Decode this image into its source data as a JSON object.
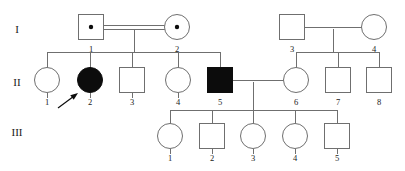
{
  "figure": {
    "type": "pedigree-chart",
    "width": 405,
    "height": 171,
    "background_color": "#ffffff",
    "line_color": "#6f6f6f",
    "affected_fill_color": "#0c0c0c",
    "unaffected_fill_color": "#ffffff",
    "text_color": "#1a1a1a"
  },
  "generation_labels": [
    {
      "name": "generation-1-label",
      "text": "I",
      "x": 17,
      "y": 30
    },
    {
      "name": "generation-2-label",
      "text": "II",
      "x": 17,
      "y": 83
    },
    {
      "name": "generation-3-label",
      "text": "III",
      "x": 17,
      "y": 133
    }
  ],
  "legend_semantics": {
    "square": "male",
    "circle": "female",
    "filled": "affected",
    "open": "unaffected",
    "center_dot": "carrier",
    "double_line": "consanguineous-mating",
    "arrow": "proband"
  },
  "individuals": [
    {
      "id": "I-1",
      "generation": "I",
      "number": "1",
      "sex": "male",
      "shape": "square",
      "status": "carrier",
      "filled": false,
      "carrier_dot": true,
      "cx": 91,
      "cy": 27,
      "size": 25
    },
    {
      "id": "I-2",
      "generation": "I",
      "number": "2",
      "sex": "female",
      "shape": "circle",
      "status": "carrier",
      "filled": false,
      "carrier_dot": true,
      "cx": 177,
      "cy": 27,
      "size": 25
    },
    {
      "id": "I-3",
      "generation": "I",
      "number": "3",
      "sex": "male",
      "shape": "square",
      "status": "unaffected",
      "filled": false,
      "carrier_dot": false,
      "cx": 292,
      "cy": 27,
      "size": 25
    },
    {
      "id": "I-4",
      "generation": "I",
      "number": "4",
      "sex": "female",
      "shape": "circle",
      "status": "unaffected",
      "filled": false,
      "carrier_dot": false,
      "cx": 374,
      "cy": 27,
      "size": 25
    },
    {
      "id": "II-1",
      "generation": "II",
      "number": "1",
      "sex": "female",
      "shape": "circle",
      "status": "unaffected",
      "filled": false,
      "carrier_dot": false,
      "cx": 47,
      "cy": 80,
      "size": 25
    },
    {
      "id": "II-2",
      "generation": "II",
      "number": "2",
      "sex": "female",
      "shape": "circle",
      "status": "affected",
      "filled": true,
      "carrier_dot": false,
      "cx": 90,
      "cy": 80,
      "size": 25,
      "proband": true
    },
    {
      "id": "II-3",
      "generation": "II",
      "number": "3",
      "sex": "male",
      "shape": "square",
      "status": "unaffected",
      "filled": false,
      "carrier_dot": false,
      "cx": 132,
      "cy": 80,
      "size": 25
    },
    {
      "id": "II-4",
      "generation": "II",
      "number": "4",
      "sex": "female",
      "shape": "circle",
      "status": "unaffected",
      "filled": false,
      "carrier_dot": false,
      "cx": 178,
      "cy": 80,
      "size": 25
    },
    {
      "id": "II-5",
      "generation": "II",
      "number": "5",
      "sex": "male",
      "shape": "square",
      "status": "affected",
      "filled": true,
      "carrier_dot": false,
      "cx": 220,
      "cy": 80,
      "size": 25
    },
    {
      "id": "II-6",
      "generation": "II",
      "number": "6",
      "sex": "female",
      "shape": "circle",
      "status": "unaffected",
      "filled": false,
      "carrier_dot": false,
      "cx": 296,
      "cy": 80,
      "size": 25
    },
    {
      "id": "II-7",
      "generation": "II",
      "number": "7",
      "sex": "male",
      "shape": "square",
      "status": "unaffected",
      "filled": false,
      "carrier_dot": false,
      "cx": 338,
      "cy": 80,
      "size": 25
    },
    {
      "id": "II-8",
      "generation": "II",
      "number": "8",
      "sex": "male",
      "shape": "square",
      "status": "unaffected",
      "filled": false,
      "carrier_dot": false,
      "cx": 379,
      "cy": 80,
      "size": 25
    },
    {
      "id": "III-1",
      "generation": "III",
      "number": "1",
      "sex": "female",
      "shape": "circle",
      "status": "unaffected",
      "filled": false,
      "carrier_dot": false,
      "cx": 170,
      "cy": 136,
      "size": 25
    },
    {
      "id": "III-2",
      "generation": "III",
      "number": "2",
      "sex": "male",
      "shape": "square",
      "status": "unaffected",
      "filled": false,
      "carrier_dot": false,
      "cx": 212,
      "cy": 136,
      "size": 25
    },
    {
      "id": "III-3",
      "generation": "III",
      "number": "3",
      "sex": "female",
      "shape": "circle",
      "status": "unaffected",
      "filled": false,
      "carrier_dot": false,
      "cx": 253,
      "cy": 136,
      "size": 25
    },
    {
      "id": "III-4",
      "generation": "III",
      "number": "4",
      "sex": "female",
      "shape": "circle",
      "status": "unaffected",
      "filled": false,
      "carrier_dot": false,
      "cx": 295,
      "cy": 136,
      "size": 25
    },
    {
      "id": "III-5",
      "generation": "III",
      "number": "5",
      "sex": "male",
      "shape": "square",
      "status": "unaffected",
      "filled": false,
      "carrier_dot": false,
      "cx": 337,
      "cy": 136,
      "size": 25
    }
  ],
  "matings": [
    {
      "name": "mating-I1-I2",
      "partners": [
        "I-1",
        "I-2"
      ],
      "consanguineous": true,
      "x1": 104,
      "x2": 165,
      "y": 27
    },
    {
      "name": "mating-I3-I4",
      "partners": [
        "I-3",
        "I-4"
      ],
      "consanguineous": false,
      "x1": 305,
      "x2": 362,
      "y": 27
    },
    {
      "name": "mating-II5-II6",
      "partners": [
        "II-5",
        "II-6"
      ],
      "consanguineous": false,
      "x1": 233,
      "x2": 284,
      "y": 80
    }
  ],
  "sibships": [
    {
      "name": "sibship-generation-2-left",
      "parents": [
        "I-1",
        "I-2"
      ],
      "children": [
        "II-1",
        "II-2",
        "II-3",
        "II-4",
        "II-5"
      ],
      "drop_x": 134,
      "drop_from_y": 29,
      "bar_y": 52,
      "bar_x1": 47,
      "bar_x2": 220
    },
    {
      "name": "sibship-generation-2-right",
      "parents": [
        "I-3",
        "I-4"
      ],
      "children": [
        "II-6",
        "II-7",
        "II-8"
      ],
      "drop_x": 333,
      "drop_from_y": 29,
      "bar_y": 52,
      "bar_x1": 296,
      "bar_x2": 379
    },
    {
      "name": "sibship-generation-3",
      "parents": [
        "II-5",
        "II-6"
      ],
      "children": [
        "III-1",
        "III-2",
        "III-3",
        "III-4",
        "III-5"
      ],
      "drop_x": 253,
      "drop_from_y": 82,
      "bar_y": 110,
      "bar_x1": 170,
      "bar_x2": 337
    }
  ],
  "proband_marker": {
    "name": "proband-arrow",
    "points_to": "II-2",
    "tail_x": 58,
    "tail_y": 108,
    "head_x": 78,
    "head_y": 93
  }
}
